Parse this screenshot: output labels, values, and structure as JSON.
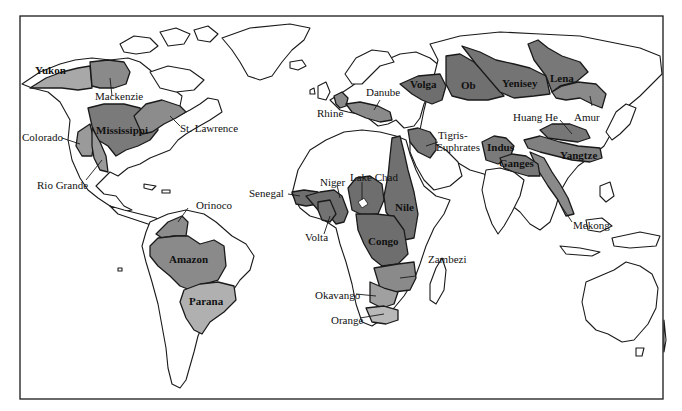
{
  "map": {
    "title": "Major river basins of the world",
    "colors": {
      "frame": "#1a1a1a",
      "land": "#ffffff",
      "basin_dark": "#6e6e6e",
      "basin_mid": "#8c8c8c",
      "basin_light": "#b3b3b3",
      "label": "#111111"
    },
    "labels": {
      "yukon": "Yukon",
      "mackenzie": "Mackenzie",
      "mississippi": "Mississippi",
      "st_lawrence": "St. Lawrence",
      "colorado": "Colorado",
      "rio_grande": "Rio Grande",
      "orinoco": "Orinoco",
      "amazon": "Amazon",
      "parana": "Parana",
      "danube": "Danube",
      "rhine": "Rhine",
      "volga": "Volga",
      "ob": "Ob",
      "yenisey": "Yenisey",
      "lena": "Lena",
      "amur": "Amur",
      "huang_he": "Huang He",
      "yangtze": "Yangtze",
      "mekong": "Mekong",
      "tigris_euphrates_1": "Tigris-",
      "tigris_euphrates_2": "Euphrates",
      "indus": "Indus",
      "ganges": "Ganges",
      "lake_chad": "Lake Chad",
      "niger": "Niger",
      "senegal": "Senegal",
      "volta": "Volta",
      "nile": "Nile",
      "congo": "Congo",
      "zambezi": "Zambezi",
      "okavango": "Okavango",
      "orange": "Orange"
    }
  }
}
